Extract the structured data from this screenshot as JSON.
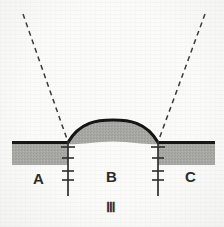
{
  "figure": {
    "caption": "Ⅲ",
    "caption_name": "roman-numeral-three",
    "background_color": "#fbfbfa"
  },
  "labels": {
    "left_block": "A",
    "center_block": "B",
    "right_block": "C"
  },
  "colors": {
    "strata_fill": "#a8a8a4",
    "strata_outline": "#141414",
    "fault_line": "#2e2e2e",
    "dashed_line": "#3a3a3a",
    "label_text": "#2a2a2a",
    "background": "#fbfbfa"
  },
  "geometry": {
    "left_bed": {
      "x_start": 12,
      "x_end": 68,
      "top_y": 142,
      "bottom_y": 165
    },
    "right_bed": {
      "x_start": 158,
      "x_end": 215,
      "top_y": 142,
      "bottom_y": 165
    },
    "arch": {
      "left_hinge_x": 68,
      "right_hinge_x": 158,
      "apex_x": 113,
      "apex_top_y": 120,
      "apex_inner_y": 142,
      "band_thickness": 22
    },
    "faults": [
      {
        "x": 68,
        "y_top": 142,
        "y_bottom": 196,
        "tick_count": 4
      },
      {
        "x": 158,
        "y_top": 142,
        "y_bottom": 196,
        "tick_count": 4
      }
    ],
    "dashed_lines": [
      {
        "x1": 23,
        "y1": 14,
        "x2": 68,
        "y2": 142
      },
      {
        "x1": 205,
        "y1": 14,
        "x2": 158,
        "y2": 142
      }
    ]
  }
}
